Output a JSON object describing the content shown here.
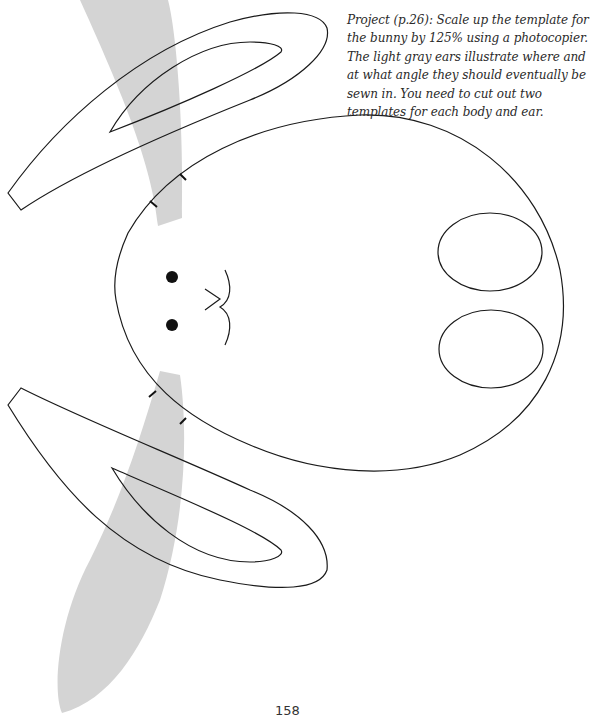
{
  "caption": {
    "text": "Project (p.26): Scale up the template for the bunny by 125% using a photocopier. The light gray ears illustrate where and at what angle they should eventually be sewn in. You need to cut out two templates for each body and ear."
  },
  "page_number": "158",
  "colors": {
    "outline": "#1a1a1a",
    "ghost_ear": "#d4d4d4",
    "background": "#ffffff"
  },
  "template": {
    "subject": "bunny",
    "scale_percent": 125,
    "pieces": [
      "body",
      "ear"
    ],
    "copies_per_piece": 2,
    "features": [
      "upper-ear-template",
      "lower-ear-template",
      "body-outline",
      "eyes",
      "nose-mouth",
      "tail-ovals",
      "ear-placement-marks",
      "ghost-ear-top",
      "ghost-ear-bottom"
    ]
  }
}
